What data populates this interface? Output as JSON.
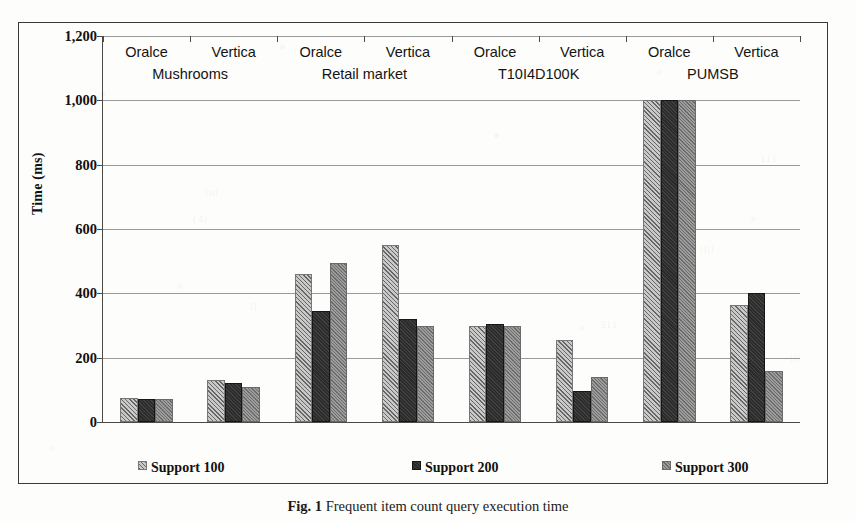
{
  "figure": {
    "caption_label": "Fig. 1",
    "caption_text": "Frequent item count query execution time",
    "y_axis_title": "Time (ms)"
  },
  "legend": {
    "position": "bottom",
    "items": [
      {
        "label": "Support 100",
        "swatch": "light-hatch-swatch",
        "color": "#c9c9c9"
      },
      {
        "label": "Support 200",
        "swatch": "dark-solid-swatch",
        "color": "#2b2b2b"
      },
      {
        "label": "Support 300",
        "swatch": "gray-hatch-swatch",
        "color": "#9d9d9d"
      }
    ]
  },
  "chart_data": {
    "type": "bar",
    "title": "Frequent item count query execution time",
    "xlabel": "",
    "ylabel": "Time (ms)",
    "ylim": [
      0,
      1200
    ],
    "ytick_labels": [
      "0",
      "200",
      "400",
      "600",
      "800",
      "1,000",
      "1,200"
    ],
    "ytick_values": [
      0,
      200,
      400,
      600,
      800,
      1000,
      1200
    ],
    "grid": true,
    "grid_axis": "y",
    "legend_position": "bottom",
    "groups": [
      "Mushrooms",
      "Retail market",
      "T10I4D100K",
      "PUMSB"
    ],
    "subcategories": [
      "Oralce",
      "Vertica"
    ],
    "categories": [
      "Mushrooms / Oralce",
      "Mushrooms / Vertica",
      "Retail market / Oralce",
      "Retail market / Vertica",
      "T10I4D100K / Oralce",
      "T10I4D100K / Vertica",
      "PUMSB / Oralce",
      "PUMSB / Vertica"
    ],
    "series": [
      {
        "name": "Support 100",
        "values": [
          75,
          130,
          460,
          550,
          298,
          255,
          1000,
          365
        ]
      },
      {
        "name": "Support 200",
        "values": [
          72,
          120,
          345,
          320,
          305,
          95,
          1000,
          400
        ]
      },
      {
        "name": "Support 300",
        "values": [
          70,
          110,
          495,
          300,
          298,
          140,
          1000,
          160
        ]
      }
    ]
  },
  "ghost_marks": [
    {
      "text": "uni",
      "x": 372,
      "y": 66
    },
    {
      "text": "lll",
      "x": 640,
      "y": 96
    },
    {
      "text": "111",
      "x": 760,
      "y": 152
    },
    {
      "text": "lnl",
      "x": 205,
      "y": 186
    },
    {
      "text": "(4)",
      "x": 193,
      "y": 212
    },
    {
      "text": "llll",
      "x": 700,
      "y": 243
    },
    {
      "text": "ll",
      "x": 250,
      "y": 300
    },
    {
      "text": "311",
      "x": 600,
      "y": 318
    },
    {
      "text": "lll",
      "x": 790,
      "y": 352
    },
    {
      "text": "tli",
      "x": 330,
      "y": 372
    }
  ]
}
